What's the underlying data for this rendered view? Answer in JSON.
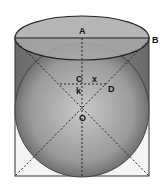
{
  "diagram": {
    "labels": {
      "A": "A",
      "B": "B",
      "C": "C",
      "D": "D",
      "O": "O",
      "k": "k",
      "x": "x"
    },
    "colors": {
      "background": "#ffffff",
      "cylinder_fill": "#7a7a7a",
      "top_ellipse_fill": "#a8a8a8",
      "sphere_center": "#c8c8c8",
      "sphere_edge": "#5a5a5a",
      "stroke": "#222222"
    }
  }
}
